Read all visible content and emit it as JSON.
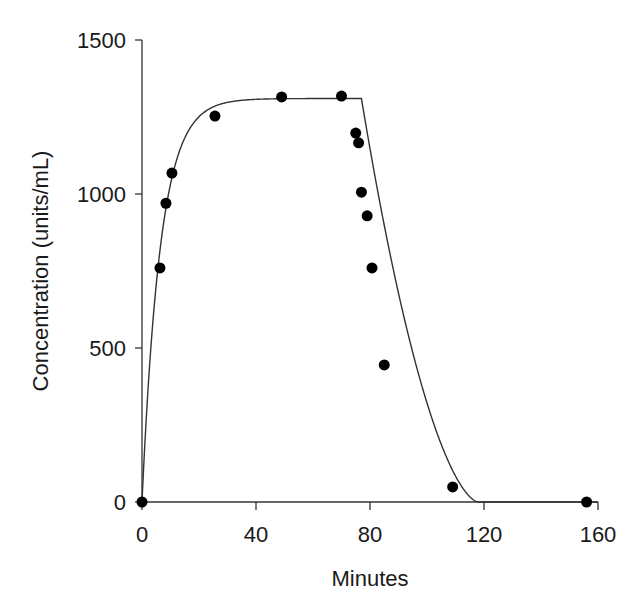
{
  "chart_data": {
    "type": "scatter",
    "title": "",
    "xlabel": "Minutes",
    "ylabel": "Concentration (units/mL)",
    "xlim": [
      0,
      160
    ],
    "ylim": [
      0,
      1500
    ],
    "x_ticks": [
      0,
      40,
      80,
      120,
      160
    ],
    "y_ticks": [
      0,
      500,
      1000,
      1500
    ],
    "x_tick_labels": [
      "0",
      "40",
      "80",
      "120",
      "160"
    ],
    "y_tick_labels": [
      "0",
      "500",
      "1000",
      "1500"
    ],
    "grid": false,
    "legend": null,
    "series": [
      {
        "name": "Measured concentration",
        "kind": "scatter",
        "color": "#000000",
        "points": [
          {
            "x": 0,
            "y": 0
          },
          {
            "x": 6.3,
            "y": 760
          },
          {
            "x": 8.4,
            "y": 970
          },
          {
            "x": 10.5,
            "y": 1068
          },
          {
            "x": 25.6,
            "y": 1253
          },
          {
            "x": 49,
            "y": 1315
          },
          {
            "x": 70,
            "y": 1318
          },
          {
            "x": 75,
            "y": 1198
          },
          {
            "x": 76,
            "y": 1166
          },
          {
            "x": 77,
            "y": 1006
          },
          {
            "x": 79,
            "y": 929
          },
          {
            "x": 80.7,
            "y": 760
          },
          {
            "x": 85,
            "y": 445
          },
          {
            "x": 109,
            "y": 49
          },
          {
            "x": 156,
            "y": 0
          }
        ]
      },
      {
        "name": "Model fit",
        "kind": "line",
        "color": "#333333",
        "description": "Infusion rise to plateau ~1310 units/mL, then decay after infusion stops at ~77 min",
        "plateau": 1310,
        "rise_rate_per_min": 0.155,
        "stop_time_min": 77,
        "decay": "sigmoidal fall reaching ~0 by ~118 min"
      }
    ]
  }
}
